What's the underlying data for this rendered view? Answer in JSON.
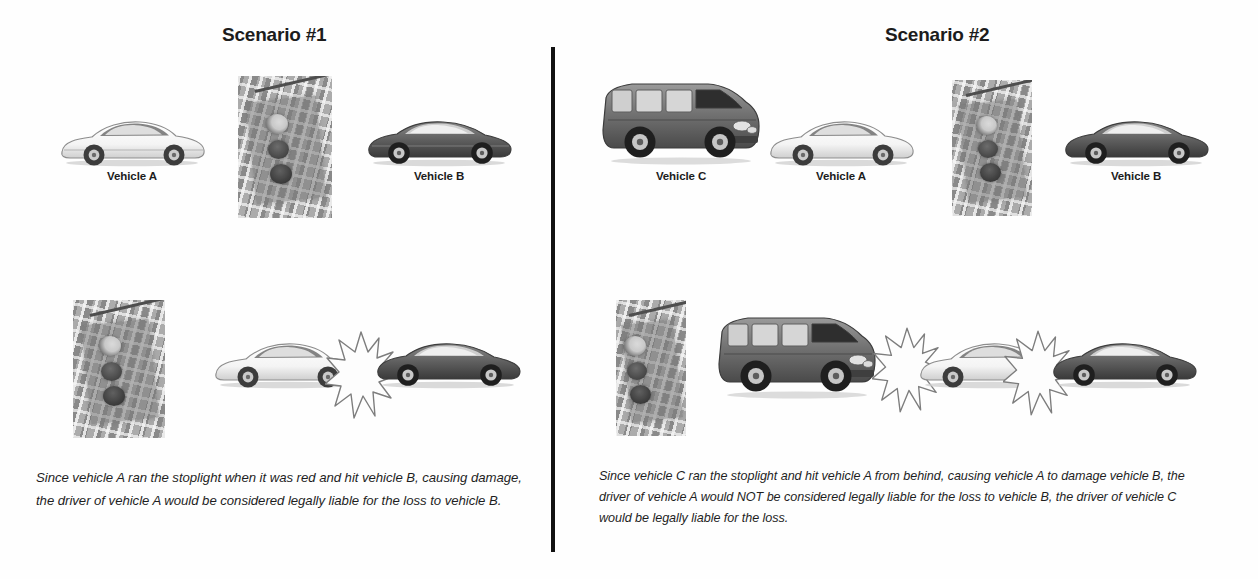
{
  "document": {
    "type": "liability-scenario-diagram",
    "divider": {
      "orientation": "vertical",
      "color": "#111111"
    }
  },
  "scenarios": [
    {
      "id": "scenario-1",
      "title": "Scenario #1",
      "before_row": {
        "items": [
          {
            "kind": "vehicle",
            "label": "Vehicle A",
            "vehicle_type": "white-convertible-coupe",
            "color": "#ffffff"
          },
          {
            "kind": "stoplight",
            "label": "",
            "signal_state": "red-lit",
            "lamps": [
              "red",
              "amber",
              "green"
            ]
          },
          {
            "kind": "vehicle",
            "label": "Vehicle B",
            "vehicle_type": "dark-sports-coupe",
            "color": "#5a5a5a"
          }
        ]
      },
      "after_row": {
        "items": [
          {
            "kind": "stoplight",
            "label": "",
            "signal_state": "red-lit",
            "lamps": [
              "red",
              "amber",
              "green"
            ]
          },
          {
            "kind": "vehicle",
            "label": "",
            "vehicle_type": "white-convertible-coupe",
            "color": "#ffffff"
          },
          {
            "kind": "impact",
            "label": "",
            "burst_count": 1
          },
          {
            "kind": "vehicle",
            "label": "",
            "vehicle_type": "dark-sports-coupe",
            "color": "#5a5a5a"
          }
        ]
      },
      "caption": "Since vehicle A ran the stoplight when it was red and hit vehicle B, causing damage, the driver of vehicle A would be considered legally liable for the loss to vehicle B."
    },
    {
      "id": "scenario-2",
      "title": "Scenario #2",
      "before_row": {
        "items": [
          {
            "kind": "vehicle",
            "label": "Vehicle C",
            "vehicle_type": "dark-suv",
            "color": "#6b6b6b"
          },
          {
            "kind": "vehicle",
            "label": "Vehicle A",
            "vehicle_type": "white-convertible-coupe",
            "color": "#ffffff"
          },
          {
            "kind": "stoplight",
            "label": "",
            "signal_state": "red-lit",
            "lamps": [
              "red",
              "amber",
              "green"
            ]
          },
          {
            "kind": "vehicle",
            "label": "Vehicle B",
            "vehicle_type": "dark-sports-coupe",
            "color": "#5a5a5a"
          }
        ]
      },
      "after_row": {
        "items": [
          {
            "kind": "stoplight",
            "label": "",
            "signal_state": "red-lit",
            "lamps": [
              "red",
              "amber",
              "green"
            ]
          },
          {
            "kind": "vehicle",
            "label": "",
            "vehicle_type": "dark-suv",
            "color": "#6b6b6b"
          },
          {
            "kind": "impact",
            "label": "",
            "burst_count": 1
          },
          {
            "kind": "vehicle",
            "label": "",
            "vehicle_type": "white-convertible-coupe",
            "color": "#ffffff"
          },
          {
            "kind": "impact",
            "label": "",
            "burst_count": 1
          },
          {
            "kind": "vehicle",
            "label": "",
            "vehicle_type": "dark-sports-coupe",
            "color": "#5a5a5a"
          }
        ]
      },
      "caption": "Since vehicle C ran the stoplight and hit vehicle A from behind, causing vehicle A to damage vehicle B, the driver of vehicle A would NOT be considered legally liable for the loss to vehicle B, the driver of vehicle C would be legally liable for the loss."
    }
  ]
}
